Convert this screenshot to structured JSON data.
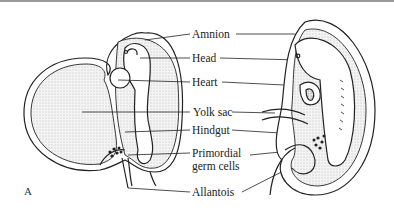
{
  "figure": {
    "panel_label": "A",
    "labels": {
      "amnion": "Amnion",
      "head": "Head",
      "heart": "Heart",
      "yolk_sac": "Yolk sac",
      "hindgut": "Hindgut",
      "primordial_1": "Primordial",
      "primordial_2": "germ cells",
      "allantois": "Allantois"
    }
  }
}
